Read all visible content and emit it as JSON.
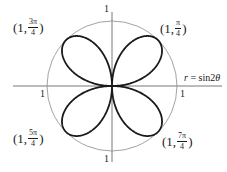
{
  "chart_data": {
    "type": "polar",
    "title": "",
    "equation_label": "r = sin2θ",
    "equation": {
      "var": "r",
      "rhs": "sin2",
      "theta": "θ"
    },
    "function": "r = sin(2θ)",
    "theta_range": [
      0,
      6.283185307
    ],
    "reference_circle_radius": 1,
    "axis_tick_labels": {
      "top": "1",
      "bottom": "1",
      "left": "1",
      "right": "1"
    },
    "annotated_points": [
      {
        "id": "p1",
        "r": 1,
        "theta": "π/4",
        "theta_num": "π",
        "theta_den": "4",
        "label": "(1, π/4)"
      },
      {
        "id": "p2",
        "r": 1,
        "theta": "3π/4",
        "theta_num": "3π",
        "theta_den": "4",
        "label": "(1, 3π/4)"
      },
      {
        "id": "p3",
        "r": 1,
        "theta": "5π/4",
        "theta_num": "5π",
        "theta_den": "4",
        "label": "(1, 5π/4)"
      },
      {
        "id": "p4",
        "r": 1,
        "theta": "7π/4",
        "theta_num": "7π",
        "theta_den": "4",
        "label": "(1, 7π/4)"
      }
    ],
    "petals": 4,
    "colors": {
      "curve": "#1a1a1a",
      "circle": "#8a8a8a",
      "axes": "#555555"
    }
  },
  "labels": {
    "tick_top": "1",
    "tick_bottom": "1",
    "tick_left": "1",
    "tick_right": "1",
    "point_prefix": "(1,",
    "point_suffix": ")",
    "p1_num": "π",
    "p2_num": "3π",
    "p3_num": "5π",
    "p4_num": "7π",
    "den": "4",
    "eq_r": "r",
    "eq_rest": " = sin2",
    "eq_theta": "θ"
  }
}
